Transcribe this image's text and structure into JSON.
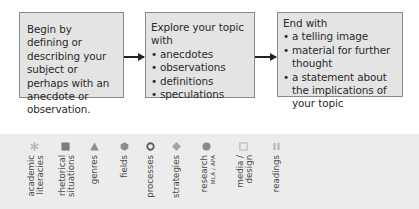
{
  "flow": {
    "box1": {
      "text": "Begin by defining or describing your subject or perhaps with an anecdote or observation."
    },
    "box2": {
      "heading": "Explore your topic with",
      "items": [
        "anecdotes",
        "observations",
        "definitions",
        "speculations"
      ]
    },
    "box3": {
      "heading": "End with",
      "items": [
        "a telling image",
        "material for further thought",
        "a statement about the implications of your topic"
      ]
    }
  },
  "nav_tabs": [
    {
      "label": "academic\nliteracies",
      "icon": "asterisk-icon",
      "color": "#b9b9b9"
    },
    {
      "label": "rhetorical\nsituations",
      "icon": "square-icon",
      "color": "#7d7d7d"
    },
    {
      "label": "genres",
      "icon": "triangle-icon",
      "color": "#8f8f8f"
    },
    {
      "label": "fields",
      "icon": "hexagon-icon",
      "color": "#8c8c8c"
    },
    {
      "label": "processes",
      "icon": "ring-icon",
      "color": "#5e5e5e"
    },
    {
      "label": "strategies",
      "icon": "diamond-icon",
      "color": "#a4a4a4"
    },
    {
      "label": "research",
      "sublabel": "MLA / APA",
      "icon": "circle-icon",
      "color": "#8a8a8a"
    },
    {
      "label": "media /\ndesign",
      "icon": "open-square-icon",
      "color": "#c4c4c4"
    },
    {
      "label": "readings",
      "icon": "pause-bars-icon",
      "color": "#bdbdbd"
    }
  ]
}
